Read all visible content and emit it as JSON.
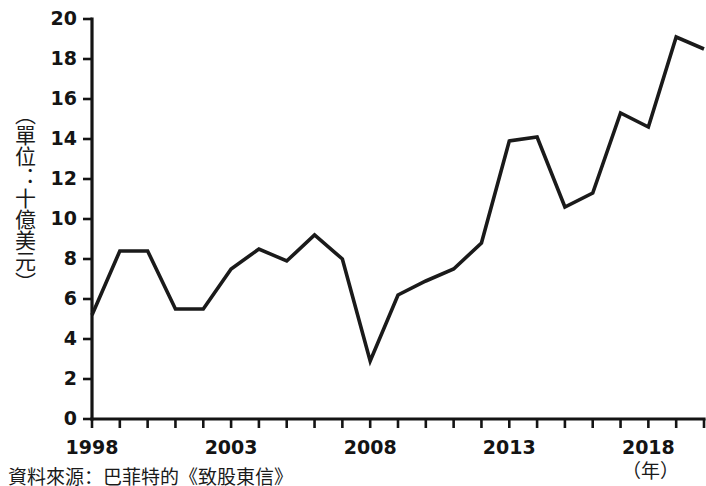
{
  "chart_data": {
    "type": "line",
    "title": "",
    "subtitle": "",
    "xlabel": "（年）",
    "ylabel": "（單位：十億美元）",
    "xlim": [
      1998,
      2020
    ],
    "ylim": [
      0,
      20
    ],
    "grid": false,
    "legend": "none",
    "series": [
      {
        "name": "",
        "color": "#1a1a1a",
        "x": [
          1998,
          1999,
          2000,
          2001,
          2002,
          2003,
          2004,
          2005,
          2006,
          2007,
          2008,
          2009,
          2010,
          2011,
          2012,
          2013,
          2014,
          2015,
          2016,
          2017,
          2018,
          2019,
          2020
        ],
        "values": [
          5.2,
          8.4,
          8.4,
          5.5,
          5.5,
          7.5,
          8.5,
          7.9,
          9.2,
          8.0,
          2.9,
          6.2,
          6.9,
          7.5,
          8.8,
          13.9,
          14.1,
          10.6,
          11.3,
          15.3,
          14.6,
          19.1,
          18.5
        ]
      }
    ],
    "y_ticks": [
      0,
      2,
      4,
      6,
      8,
      10,
      12,
      14,
      16,
      18,
      20
    ],
    "y_tick_labels": [
      "0",
      "2",
      "4",
      "6",
      "8",
      "10",
      "12",
      "14",
      "16",
      "18",
      "20"
    ],
    "x_ticks": [
      1998,
      1999,
      2000,
      2001,
      2002,
      2003,
      2004,
      2005,
      2006,
      2007,
      2008,
      2009,
      2010,
      2011,
      2012,
      2013,
      2014,
      2015,
      2016,
      2017,
      2018,
      2019,
      2020
    ],
    "x_tick_labels_shown": [
      {
        "value": 1998,
        "label": "1998"
      },
      {
        "value": 2003,
        "label": "2003"
      },
      {
        "value": 2008,
        "label": "2008"
      },
      {
        "value": 2013,
        "label": "2013"
      },
      {
        "value": 2018,
        "label": "2018"
      }
    ]
  },
  "axis": {
    "y_title": "（單位：十億美元）",
    "x_title": "（年）"
  },
  "footer": {
    "source_note": "資料來源：巴菲特的《致股東信》"
  }
}
